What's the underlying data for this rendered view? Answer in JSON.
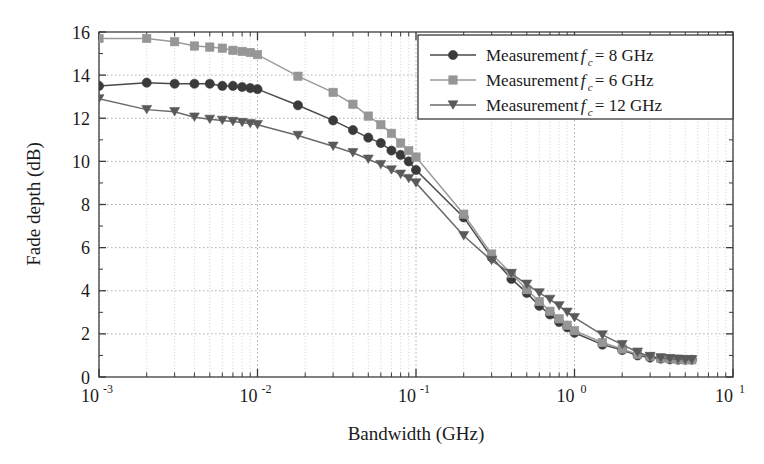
{
  "chart_data": {
    "type": "line",
    "title": "",
    "xlabel": "Bandwidth (GHz)",
    "ylabel": "Fade depth (dB)",
    "xscale": "log",
    "yscale": "linear",
    "xlim": [
      0.001,
      10
    ],
    "ylim": [
      0,
      16
    ],
    "xticks": [
      0.001,
      0.01,
      0.1,
      1,
      10
    ],
    "xtick_labels": [
      "10^-3",
      "10^-2",
      "10^-1",
      "10^0",
      "10^1"
    ],
    "xtick_mantissas": [
      "10",
      "10",
      "10",
      "10",
      "10"
    ],
    "xtick_exponents": [
      "-3",
      "-2",
      "-1",
      "0",
      "1"
    ],
    "yticks": [
      0,
      2,
      4,
      6,
      8,
      10,
      12,
      14,
      16
    ],
    "ytick_labels": [
      "0",
      "2",
      "4",
      "6",
      "8",
      "10",
      "12",
      "14",
      "16"
    ],
    "grid": true,
    "grid_style": "dotted",
    "grid_minor": true,
    "legend_position": "upper right",
    "series": [
      {
        "name": "Measurement fc = 8 GHz",
        "label_prefix": "Measurement ",
        "label_var": "f",
        "label_sub": "c",
        "label_suffix": " = 8 GHz",
        "marker": "circle",
        "color": "#3a3a3a",
        "line_color": "#4a4a4a",
        "x": [
          0.001,
          0.002,
          0.003,
          0.004,
          0.005,
          0.006,
          0.007,
          0.008,
          0.009,
          0.01,
          0.018,
          0.03,
          0.04,
          0.05,
          0.06,
          0.07,
          0.08,
          0.09,
          0.1,
          0.2,
          0.3,
          0.4,
          0.5,
          0.6,
          0.7,
          0.8,
          0.9,
          1.0,
          1.5,
          2.0,
          2.5,
          3.0,
          3.5,
          4.0,
          4.5,
          5.0,
          5.5
        ],
        "y": [
          13.5,
          13.65,
          13.6,
          13.6,
          13.6,
          13.5,
          13.5,
          13.45,
          13.4,
          13.35,
          12.6,
          11.9,
          11.45,
          11.1,
          10.85,
          10.5,
          10.3,
          10.0,
          9.6,
          7.4,
          5.55,
          4.55,
          3.9,
          3.3,
          2.9,
          2.55,
          2.3,
          2.05,
          1.5,
          1.25,
          1.0,
          0.9,
          0.85,
          0.82,
          0.8,
          0.8,
          0.8
        ]
      },
      {
        "name": "Measurement fc = 6 GHz",
        "label_prefix": "Measurement ",
        "label_var": "f",
        "label_sub": "c",
        "label_suffix": " = 6 GHz",
        "marker": "square",
        "color": "#969696",
        "line_color": "#9a9a9a",
        "x": [
          0.001,
          0.002,
          0.003,
          0.004,
          0.005,
          0.006,
          0.007,
          0.008,
          0.009,
          0.01,
          0.018,
          0.03,
          0.04,
          0.05,
          0.06,
          0.07,
          0.08,
          0.09,
          0.1,
          0.2,
          0.3,
          0.4,
          0.5,
          0.6,
          0.7,
          0.8,
          0.9,
          1.0,
          1.5,
          2.0,
          2.5,
          3.0,
          3.5,
          4.0,
          4.5,
          5.0,
          5.5
        ],
        "y": [
          15.7,
          15.7,
          15.55,
          15.35,
          15.3,
          15.25,
          15.15,
          15.1,
          15.05,
          14.95,
          13.95,
          13.2,
          12.65,
          12.1,
          11.7,
          11.3,
          10.85,
          10.5,
          10.2,
          7.55,
          5.7,
          4.8,
          4.05,
          3.5,
          3.05,
          2.7,
          2.4,
          2.15,
          1.6,
          1.3,
          1.05,
          0.95,
          0.88,
          0.85,
          0.82,
          0.8,
          0.8
        ]
      },
      {
        "name": "Measurement fc = 12 GHz",
        "label_prefix": "Measurement ",
        "label_var": "f",
        "label_sub": "c",
        "label_suffix": " = 12 GHz",
        "marker": "triangle-down",
        "color": "#5a5a5a",
        "line_color": "#6a6a6a",
        "x": [
          0.001,
          0.002,
          0.003,
          0.004,
          0.005,
          0.006,
          0.007,
          0.008,
          0.009,
          0.01,
          0.018,
          0.03,
          0.04,
          0.05,
          0.06,
          0.07,
          0.08,
          0.09,
          0.1,
          0.2,
          0.3,
          0.4,
          0.5,
          0.6,
          0.7,
          0.8,
          0.9,
          1.0,
          1.5,
          2.0,
          2.5,
          3.0,
          3.5,
          4.0,
          4.5,
          5.0,
          5.5
        ],
        "y": [
          12.9,
          12.4,
          12.3,
          12.05,
          11.95,
          11.9,
          11.85,
          11.8,
          11.75,
          11.7,
          11.2,
          10.7,
          10.4,
          10.1,
          9.85,
          9.6,
          9.4,
          9.2,
          9.0,
          6.55,
          5.4,
          4.8,
          4.3,
          3.9,
          3.6,
          3.3,
          3.0,
          2.75,
          1.95,
          1.5,
          1.15,
          0.95,
          0.88,
          0.85,
          0.82,
          0.8,
          0.8
        ]
      }
    ]
  },
  "axes": {
    "xlabel": "Bandwidth (GHz)",
    "ylabel": "Fade depth (dB)"
  }
}
